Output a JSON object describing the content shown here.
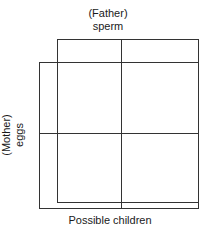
{
  "figure": {
    "width": 216,
    "height": 237,
    "background_color": "#ffffff",
    "line_color": "#333333",
    "text_color": "#1a1a1a"
  },
  "labels": {
    "top": {
      "line1": "(Father)",
      "line2": "sperm"
    },
    "left": {
      "line1": "(Mother)",
      "line2": "eggs"
    },
    "bottom": "Possible children"
  },
  "diagram": {
    "type": "punnett-square",
    "father_rect": {
      "x": 57,
      "y": 39,
      "width": 142,
      "height": 164
    },
    "mother_rect": {
      "x": 39,
      "y": 62,
      "width": 160,
      "height": 147
    },
    "divider_vertical_x": 121,
    "divider_horizontal_y": 133,
    "columns": 2,
    "rows": 2
  }
}
